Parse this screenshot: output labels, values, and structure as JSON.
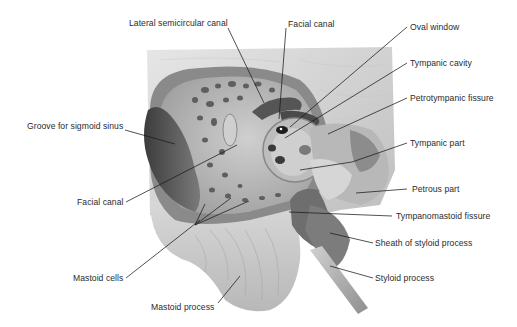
{
  "figure": {
    "labels_left": [
      {
        "id": "lateral-semicircular-canal",
        "text": "Lateral semicircular canal",
        "x": 129,
        "y": 17
      },
      {
        "id": "groove-sigmoid-sinus",
        "text": "Groove for sigmoid sinus",
        "x": 27,
        "y": 122
      },
      {
        "id": "facial-canal-left",
        "text": "Facial canal",
        "x": 77,
        "y": 198
      },
      {
        "id": "mastoid-cells",
        "text": "Mastoid cells",
        "x": 73,
        "y": 274
      },
      {
        "id": "mastoid-process",
        "text": "Mastoid process",
        "x": 151,
        "y": 142
      }
    ],
    "labels_top": [
      {
        "id": "facial-canal-top",
        "text": "Facial canal"
      }
    ],
    "labels_right": [
      {
        "id": "oval-window",
        "text": "Oval window"
      },
      {
        "id": "tympanic-cavity",
        "text": "Tympanic cavity"
      },
      {
        "id": "petrotympanic-fissure",
        "text": "Petrotympanic fissure"
      },
      {
        "id": "tympanic-part",
        "text": "Tympanic part"
      },
      {
        "id": "petrous-part",
        "text": "Petrous part"
      },
      {
        "id": "tympanomastoid-fissure",
        "text": "Tympanomastoid fissure"
      },
      {
        "id": "sheath-styloid",
        "text": "Sheath of styloid process"
      },
      {
        "id": "styloid-process",
        "text": "Styloid process"
      }
    ]
  },
  "text": {
    "lateral_semicircular_canal": "Lateral semicircular canal",
    "facial_canal_top": "Facial canal",
    "oval_window": "Oval window",
    "tympanic_cavity": "Tympanic cavity",
    "petrotympanic_fissure": "Petrotympanic fissure",
    "groove_sigmoid": "Groove for sigmoid sinus",
    "tympanic_part": "Tympanic part",
    "petrous_part": "Petrous part",
    "facial_canal_left": "Facial canal",
    "tympanomastoid_fissure": "Tympanomastoid fissure",
    "sheath_styloid": "Sheath of styloid process",
    "mastoid_cells": "Mastoid cells",
    "styloid_process": "Styloid process",
    "mastoid_process": "Mastoid process"
  },
  "colors": {
    "background": "#ffffff",
    "label_text": "#2b2b2b",
    "leader_line": "#1a1a1a",
    "bone_light": "#dcdcdc",
    "bone_mid": "#a9a9a9",
    "bone_dark": "#5a5a5a",
    "cavity_dark": "#3a3a3a"
  }
}
